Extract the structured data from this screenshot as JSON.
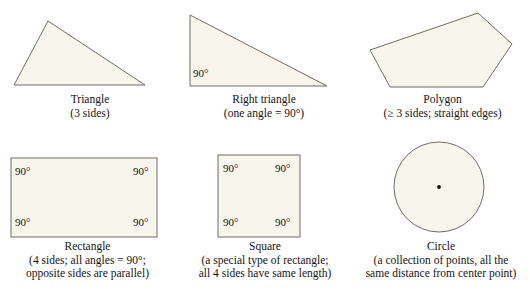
{
  "page": {
    "width": 530,
    "height": 300,
    "background": "#ffffff",
    "shape_fill": "#f7f5ec",
    "shape_stroke": "#706c66",
    "text_color": "#141414"
  },
  "figures": [
    {
      "id": "triangle",
      "shape": "triangle",
      "name": "Triangle",
      "description": "(3 sides)",
      "angle_labels": [],
      "geometry": {
        "points": "48,21 145,85 14,85"
      }
    },
    {
      "id": "right-triangle",
      "shape": "right-triangle",
      "name": "Right triangle",
      "description": "(one angle = 90°)",
      "angle_labels": [
        {
          "text": "90°",
          "x": 193,
          "y": 68
        }
      ],
      "geometry": {
        "points": "190,15 327,86 190,86"
      }
    },
    {
      "id": "polygon",
      "shape": "pentagon",
      "name": "Polygon",
      "description": "(≥ 3 sides; straight edges)",
      "angle_labels": [],
      "geometry": {
        "points": "478,13 512,44 483,87 390,87 370,50"
      }
    },
    {
      "id": "rectangle",
      "shape": "rectangle",
      "name": "Rectangle",
      "description_line1": "(4 sides; all angles = 90°;",
      "description_line2": "opposite sides are parallel)",
      "angle_labels": [
        {
          "text": "90°",
          "x": 15,
          "y": 166
        },
        {
          "text": "90°",
          "x": 133,
          "y": 166
        },
        {
          "text": "90°",
          "x": 15,
          "y": 217
        },
        {
          "text": "90°",
          "x": 133,
          "y": 217
        }
      ],
      "geometry": {
        "x": 11,
        "y": 158,
        "width": 146,
        "height": 79
      }
    },
    {
      "id": "square",
      "shape": "square",
      "name": "Square",
      "description_line1": "(a special type of rectangle;",
      "description_line2": "all 4 sides have same length)",
      "angle_labels": [
        {
          "text": "90°",
          "x": 223,
          "y": 163
        },
        {
          "text": "90°",
          "x": 275,
          "y": 163
        },
        {
          "text": "90°",
          "x": 223,
          "y": 217
        },
        {
          "text": "90°",
          "x": 275,
          "y": 217
        }
      ],
      "geometry": {
        "x": 218,
        "y": 155,
        "width": 82,
        "height": 82
      }
    },
    {
      "id": "circle",
      "shape": "circle",
      "name": "Circle",
      "description_line1": "(a collection of points, all the",
      "description_line2": "same distance from center point)",
      "angle_labels": [],
      "geometry": {
        "cx": 439,
        "cy": 187,
        "r": 45,
        "center_dot_r": 1.9
      }
    }
  ],
  "captions": {
    "triangle": {
      "line1": "Triangle",
      "line2": "(3 sides)",
      "left": 20,
      "top": 93,
      "width": 140
    },
    "right_triangle": {
      "line1": "Right triangle",
      "line2": "(one angle = 90°)",
      "left": 188,
      "top": 93,
      "width": 152
    },
    "polygon": {
      "line1": "Polygon",
      "line2": "(≥ 3 sides; straight edges)",
      "left": 355,
      "top": 93,
      "width": 175
    },
    "rectangle": {
      "line1": "Rectangle",
      "line2": "(4 sides; all angles = 90°;",
      "line3": "opposite sides are parallel)",
      "left": 0,
      "top": 240,
      "width": 175
    },
    "square": {
      "line1": "Square",
      "line2": "(a special type of rectangle;",
      "line3": "all 4 sides have same length)",
      "left": 175,
      "top": 240,
      "width": 180
    },
    "circle": {
      "line1": "Circle",
      "line2": "(a collection of points, all the",
      "line3": "same distance from center point)",
      "left": 352,
      "top": 240,
      "width": 178
    }
  }
}
